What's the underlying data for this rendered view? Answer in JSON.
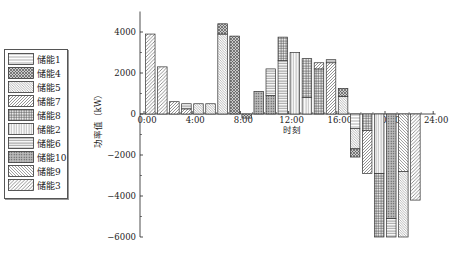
{
  "chart_data": {
    "type": "bar",
    "title": "",
    "xlabel": "时刻",
    "ylabel": "功率值（kW）",
    "ylim": [
      -6000,
      5000
    ],
    "yticks": [
      -6000,
      -4000,
      -2000,
      0,
      2000,
      4000
    ],
    "xticks": [
      "0:00",
      "4:00",
      "8:00",
      "12:00",
      "16:00",
      "20:00",
      "24:00"
    ],
    "x": [
      0,
      1,
      2,
      3,
      4,
      5,
      6,
      7,
      8,
      9,
      10,
      11,
      12,
      13,
      14,
      15,
      16,
      17,
      18,
      19,
      20,
      21,
      22,
      23
    ],
    "bars": [
      {
        "hour": 0,
        "segments": [
          {
            "unit": "储能3",
            "from": 0,
            "to": 3900
          }
        ]
      },
      {
        "hour": 1,
        "segments": [
          {
            "unit": "储能3",
            "from": 0,
            "to": 2300
          }
        ]
      },
      {
        "hour": 2,
        "segments": [
          {
            "unit": "储能7",
            "from": 0,
            "to": 600
          }
        ]
      },
      {
        "hour": 3,
        "segments": [
          {
            "unit": "储能7",
            "from": 0,
            "to": 250
          },
          {
            "unit": "储能6",
            "from": 250,
            "to": 500
          }
        ]
      },
      {
        "hour": 4,
        "segments": [
          {
            "unit": "储能5",
            "from": 0,
            "to": 500
          }
        ]
      },
      {
        "hour": 5,
        "segments": [
          {
            "unit": "储能5",
            "from": 0,
            "to": 500
          }
        ]
      },
      {
        "hour": 6,
        "segments": [
          {
            "unit": "储能5",
            "from": 0,
            "to": 3900
          },
          {
            "unit": "储能4",
            "from": 3900,
            "to": 4400
          }
        ]
      },
      {
        "hour": 7,
        "segments": [
          {
            "unit": "储能4",
            "from": 0,
            "to": 3800
          }
        ]
      },
      {
        "hour": 8,
        "segments": [
          {
            "unit": "储能4",
            "from": 0,
            "to": -200
          }
        ]
      },
      {
        "hour": 9,
        "segments": [
          {
            "unit": "储能10",
            "from": 0,
            "to": 1100
          }
        ]
      },
      {
        "hour": 10,
        "segments": [
          {
            "unit": "储能10",
            "from": 0,
            "to": 900
          },
          {
            "unit": "储能6",
            "from": 900,
            "to": 2200
          }
        ]
      },
      {
        "hour": 11,
        "segments": [
          {
            "unit": "储能6",
            "from": 0,
            "to": 2600
          },
          {
            "unit": "储能8",
            "from": 2600,
            "to": 3750
          }
        ]
      },
      {
        "hour": 12,
        "segments": [
          {
            "unit": "储能2",
            "from": 0,
            "to": 3000
          }
        ]
      },
      {
        "hour": 13,
        "segments": [
          {
            "unit": "储能2",
            "from": 0,
            "to": 800
          },
          {
            "unit": "储能8",
            "from": 800,
            "to": 2700
          }
        ]
      },
      {
        "hour": 14,
        "segments": [
          {
            "unit": "储能8",
            "from": 0,
            "to": 2200
          },
          {
            "unit": "储能7",
            "from": 2200,
            "to": 2500
          }
        ]
      },
      {
        "hour": 15,
        "segments": [
          {
            "unit": "储能7",
            "from": 0,
            "to": 2500
          },
          {
            "unit": "储能6",
            "from": 2500,
            "to": 2650
          }
        ]
      },
      {
        "hour": 16,
        "segments": [
          {
            "unit": "储能5",
            "from": 0,
            "to": 850
          },
          {
            "unit": "储能4",
            "from": 850,
            "to": 1250
          }
        ]
      },
      {
        "hour": 17,
        "segments": [
          {
            "unit": "储能1",
            "from": 0,
            "to": -700
          },
          {
            "unit": "储能5",
            "from": -700,
            "to": -1700
          },
          {
            "unit": "储能4",
            "from": -1700,
            "to": -2100
          }
        ]
      },
      {
        "hour": 18,
        "segments": [
          {
            "unit": "储能8",
            "from": 0,
            "to": -800
          },
          {
            "unit": "储能7",
            "from": -800,
            "to": -2900
          }
        ]
      },
      {
        "hour": 19,
        "segments": [
          {
            "unit": "储能2",
            "from": 0,
            "to": -2900
          },
          {
            "unit": "储能8",
            "from": -2900,
            "to": -6000
          }
        ]
      },
      {
        "hour": 20,
        "segments": [
          {
            "unit": "储能10",
            "from": 0,
            "to": -5100
          },
          {
            "unit": "储能6",
            "from": -5100,
            "to": -6000
          }
        ]
      },
      {
        "hour": 21,
        "segments": [
          {
            "unit": "储能9",
            "from": 0,
            "to": -2800
          },
          {
            "unit": "储能5",
            "from": -2800,
            "to": -6000
          }
        ]
      },
      {
        "hour": 22,
        "segments": [
          {
            "unit": "储能3",
            "from": 0,
            "to": -4200
          }
        ]
      }
    ],
    "legend": [
      "储能1",
      "储能4",
      "储能5",
      "储能7",
      "储能8",
      "储能2",
      "储能6",
      "储能10",
      "储能9",
      "储能3"
    ],
    "legend_position": "left-outside",
    "grid": false
  },
  "legend": {
    "items": [
      {
        "label": "储能1",
        "pattern": "hlines"
      },
      {
        "label": "储能4",
        "pattern": "cross"
      },
      {
        "label": "储能5",
        "pattern": "diag-fine"
      },
      {
        "label": "储能7",
        "pattern": "diag"
      },
      {
        "label": "储能8",
        "pattern": "grid"
      },
      {
        "label": "储能2",
        "pattern": "vlines"
      },
      {
        "label": "储能6",
        "pattern": "hlines2"
      },
      {
        "label": "储能10",
        "pattern": "dots"
      },
      {
        "label": "储能9",
        "pattern": "diag-back"
      },
      {
        "label": "储能3",
        "pattern": "diag2"
      }
    ]
  },
  "axes": {
    "xlabel": "时刻",
    "ylabel": "功率值（kW）"
  }
}
